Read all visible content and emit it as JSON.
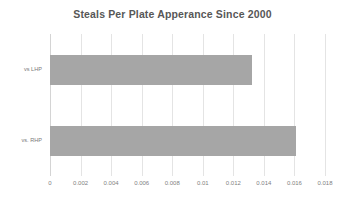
{
  "chart_data": {
    "type": "bar",
    "orientation": "horizontal",
    "title": "Steals Per Plate Apperance Since 2000",
    "xlabel": "",
    "ylabel": "",
    "categories": [
      "vs LHP",
      "vs. RHP"
    ],
    "values": [
      0.0132,
      0.0161
    ],
    "xlim": [
      0,
      0.018
    ],
    "xticks": [
      0,
      0.002,
      0.004,
      0.006,
      0.008,
      0.01,
      0.012,
      0.014,
      0.016,
      0.018
    ],
    "xtick_labels": [
      "0",
      "0.002",
      "0.004",
      "0.006",
      "0.008",
      "0.01",
      "0.012",
      "0.014",
      "0.016",
      "0.018"
    ],
    "grid": true,
    "grid_axis": "x",
    "legend": false,
    "legend_position": "none",
    "series": [
      {
        "name": "Steals Per Plate Apperance",
        "values": [
          0.0132,
          0.0161
        ]
      }
    ]
  },
  "style": {
    "bar_color": "#a6a6a6",
    "grid_color": "#e4e4e4",
    "axis_color": "#d4d4d4",
    "title_color": "#575757",
    "tick_label_color": "#7f7f7f",
    "category_label_color": "#7a7a7a",
    "background": "#ffffff"
  }
}
